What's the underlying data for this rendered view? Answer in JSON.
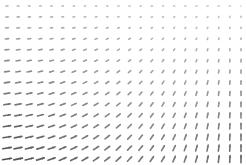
{
  "chart_data": {
    "type": "quiver",
    "title": "",
    "xlabel": "",
    "ylabel": "",
    "axes_visible": false,
    "grid": false,
    "legend": null,
    "grid_cols": 22,
    "grid_rows": 15,
    "x_range": [
      -1,
      1
    ],
    "y_range": [
      -1,
      1
    ],
    "field_description": "Arrows short and horizontal (pointing right) at top-left; long diagonal (up-right) at bottom-left; near-vertical slightly leaning left at bottom-right; near-zero length at top-right.",
    "field": {
      "u": "0.55*(1 - x) * (0.6 - 0.4*y)",
      "v": "0.9*(0.5 - 0.5*y) * (0.6 + 0.4*x)"
    },
    "arrow_color": "#555555",
    "arrow_max_length_px": 9
  }
}
